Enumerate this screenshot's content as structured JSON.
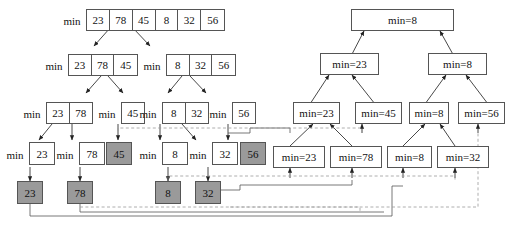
{
  "diagram": {
    "colors": {
      "box_border": "#555555",
      "box_fill": "#ffffff",
      "shaded_fill": "#9a9a9a",
      "solid_line": "#333333",
      "dashed_line": "#888888",
      "text": "#111111"
    },
    "min_label": "min"
  },
  "left_tree": {
    "levels": [
      {
        "level": 0,
        "groups": [
          {
            "label": "min",
            "values": [
              "23",
              "78",
              "45",
              "8",
              "32",
              "56"
            ]
          }
        ]
      },
      {
        "level": 1,
        "groups": [
          {
            "label": "min",
            "values": [
              "23",
              "78",
              "45"
            ]
          },
          {
            "label": "min",
            "values": [
              "8",
              "32",
              "56"
            ]
          }
        ]
      },
      {
        "level": 2,
        "groups": [
          {
            "label": "min",
            "values": [
              "23",
              "78"
            ]
          },
          {
            "label": "min",
            "values": [
              "45"
            ]
          },
          {
            "label": "min",
            "values": [
              "8",
              "32"
            ]
          },
          {
            "label": "min",
            "values": [
              "56"
            ]
          }
        ]
      },
      {
        "level": 3,
        "groups": [
          {
            "label": "min",
            "values": [
              "23"
            ],
            "shaded": false
          },
          {
            "label": "min",
            "values": [
              "78"
            ],
            "shaded": false
          },
          {
            "label": "",
            "values": [
              "45"
            ],
            "shaded": true
          },
          {
            "label": "min",
            "values": [
              "8"
            ],
            "shaded": false
          },
          {
            "label": "min",
            "values": [
              "32"
            ],
            "shaded": false
          },
          {
            "label": "",
            "values": [
              "56"
            ],
            "shaded": true
          }
        ]
      },
      {
        "level": 4,
        "groups": [
          {
            "label": "",
            "values": [
              "23"
            ],
            "shaded": true
          },
          {
            "label": "",
            "values": [
              "78"
            ],
            "shaded": true
          },
          {
            "label": "",
            "values": [
              "8"
            ],
            "shaded": true
          },
          {
            "label": "",
            "values": [
              "32"
            ],
            "shaded": true
          }
        ]
      }
    ]
  },
  "right_tree": {
    "levels": [
      {
        "level": 0,
        "nodes": [
          "min=8"
        ]
      },
      {
        "level": 1,
        "nodes": [
          "min=23",
          "min=8"
        ]
      },
      {
        "level": 2,
        "nodes": [
          "min=23",
          "min=45",
          "min=8",
          "min=56"
        ]
      },
      {
        "level": 3,
        "nodes": [
          "min=23",
          "min=78",
          "min=8",
          "min=32"
        ]
      }
    ]
  }
}
